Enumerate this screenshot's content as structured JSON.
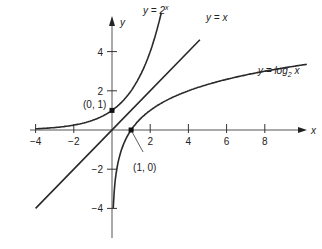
{
  "chart_data": {
    "type": "line",
    "title": "",
    "xlabel": "x",
    "ylabel": "y",
    "xlim": [
      -4.2,
      10
    ],
    "ylim": [
      -5.2,
      6
    ],
    "grid": false,
    "x_ticks": [
      -4,
      -2,
      2,
      4,
      6,
      8
    ],
    "y_ticks": [
      4,
      2,
      -2,
      -4
    ],
    "x_tick_labels": [
      "−4",
      "−2",
      "2",
      "4",
      "6",
      "8"
    ],
    "y_tick_labels": [
      "4",
      "2",
      "−2",
      "−4"
    ],
    "series": [
      {
        "name": "y = 2^x",
        "label": "y = 2",
        "label_sup": "x",
        "function": "2^x"
      },
      {
        "name": "y = x",
        "label": "y = x",
        "function": "x"
      },
      {
        "name": "y = log2 x",
        "label": "y = log",
        "label_sub": "2",
        "label_tail": " x",
        "function": "log2(x)"
      }
    ],
    "points": [
      {
        "x": 0,
        "y": 1,
        "label": "(0, 1)"
      },
      {
        "x": 1,
        "y": 0,
        "label": "(1, 0)"
      }
    ]
  }
}
